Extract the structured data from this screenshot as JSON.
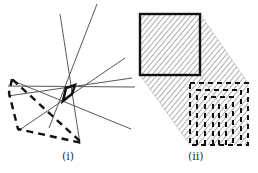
{
  "figure": {
    "panels": [
      {
        "id": "i",
        "caption": "(i)",
        "description": "Arrangement of lines with a small bold convex polygon (cell) at the center and a large dashed polygon enclosing region",
        "lines": [
          [
            [
              60,
              14
            ],
            [
              80,
              144
            ]
          ],
          [
            [
              97,
              0
            ],
            [
              48,
              128
            ]
          ],
          [
            [
              121,
              59
            ],
            [
              18,
              100
            ]
          ],
          [
            [
              8,
              86
            ],
            [
              132,
              86
            ]
          ],
          [
            [
              16,
              93
            ],
            [
              132,
              78
            ]
          ],
          [
            [
              8,
              82
            ],
            [
              130,
              128
            ]
          ]
        ],
        "bold_polygon": [
          [
            66,
            88
          ],
          [
            76,
            86
          ],
          [
            72,
            96
          ],
          [
            63,
            101
          ]
        ],
        "dashed_polygon": [
          [
            11,
            79
          ],
          [
            80,
            141
          ],
          [
            18,
            129
          ],
          [
            9,
            93
          ]
        ]
      },
      {
        "id": "ii",
        "caption": "(ii)",
        "description": "Solid square projected (hatched shadow) onto a dashed square grid of nested dashed columns",
        "solid_square": {
          "x": 140,
          "y": 14,
          "w": 60,
          "h": 61
        },
        "dashed_square": {
          "x": 190,
          "y": 83,
          "w": 58,
          "h": 62
        },
        "colors": {
          "stroke": "#1a1a1a",
          "hatch": "#9a9a9a"
        }
      }
    ]
  }
}
